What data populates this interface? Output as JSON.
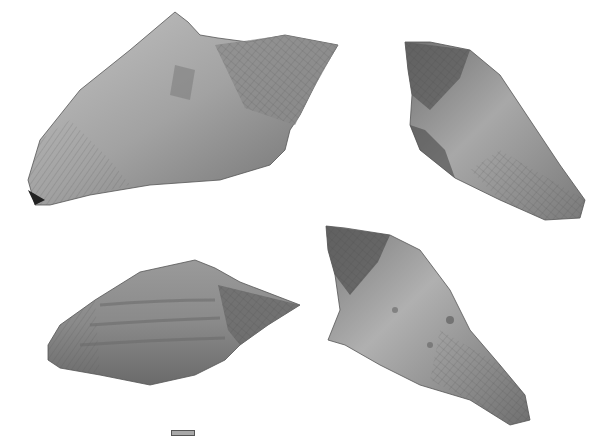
{
  "figure": {
    "type": "fossil gastropod specimen plate",
    "background": "#ffffff",
    "specimens": [
      {
        "position": "top-left",
        "view": "apertural view, spire to upper right",
        "tone": "#9a9a9a"
      },
      {
        "position": "top-right",
        "view": "abapertural view, spire to upper left",
        "tone": "#8c8c8c"
      },
      {
        "position": "bottom-left",
        "view": "lateral view, spire to right",
        "tone": "#8a8a8a"
      },
      {
        "position": "bottom-right",
        "view": "abapertural view, spire to upper left",
        "tone": "#909090"
      }
    ],
    "scale_bar": {
      "label": "",
      "color": "#a8a8a8"
    }
  }
}
